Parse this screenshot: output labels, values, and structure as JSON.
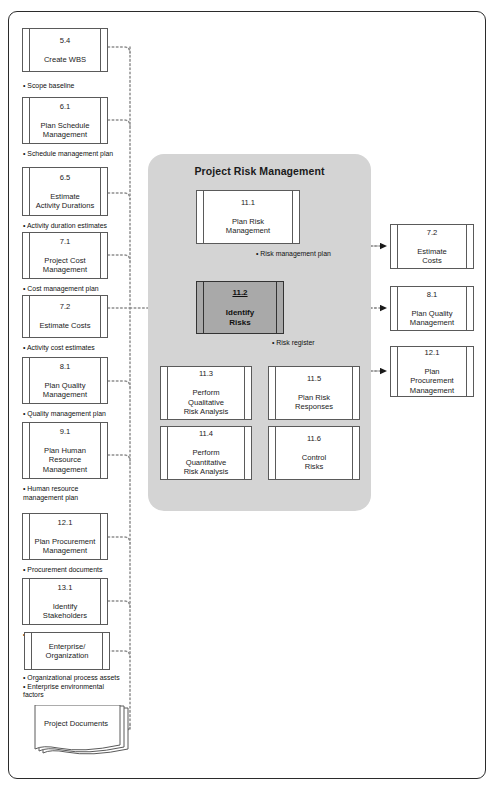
{
  "diagram": {
    "panel_title": "Project Risk Management",
    "accent_color": "#d4d4d4",
    "highlight_color": "#a9a9a9",
    "frame_color": "#2b2b2b"
  },
  "inputs": [
    {
      "name": "create-wbs",
      "num": "5.4",
      "title": "Create WBS",
      "note": "• Scope baseline"
    },
    {
      "name": "plan-schedule-management",
      "num": "6.1",
      "title": "Plan Schedule\nManagement",
      "note": "• Schedule management plan"
    },
    {
      "name": "estimate-activity-durations",
      "num": "6.5",
      "title": "Estimate\nActivity Durations",
      "note": "• Activity duration estimates"
    },
    {
      "name": "project-cost-management",
      "num": "7.1",
      "title": "Project Cost\nManagement",
      "note": "• Cost management plan"
    },
    {
      "name": "estimate-costs",
      "num": "7.2",
      "title": "Estimate Costs",
      "note": "• Activity cost estimates"
    },
    {
      "name": "plan-quality-management",
      "num": "8.1",
      "title": "Plan Quality\nManagement",
      "note": "• Quality management plan"
    },
    {
      "name": "plan-human-resource-management",
      "num": "9.1",
      "title": "Plan Human\nResource\nManagement",
      "note": "• Human resource\n   management plan"
    },
    {
      "name": "plan-procurement-management",
      "num": "12.1",
      "title": "Plan Procurement\nManagement",
      "note": "• Procurement documents"
    },
    {
      "name": "identify-stakeholders",
      "num": "13.1",
      "title": "Identify\nStakeholders",
      "note": "• Stakeholder register"
    }
  ],
  "enterprise": {
    "title": "Enterprise/\nOrganization",
    "note": "• Organizational process assets\n• Enterprise environmental\n   factors"
  },
  "project_documents": {
    "title": "Project\nDocuments"
  },
  "risk_processes": {
    "plan_risk_management": {
      "num": "11.1",
      "title": "Plan Risk\nManagement"
    },
    "identify_risks": {
      "num": "11.2",
      "title": "Identify\nRisks"
    },
    "perform_qualitative_analysis": {
      "num": "11.3",
      "title": "Perform\nQualitative\nRisk Analysis"
    },
    "perform_quantitative_analysis": {
      "num": "11.4",
      "title": "Perform\nQuantitative\nRisk Analysis"
    },
    "plan_risk_responses": {
      "num": "11.5",
      "title": "Plan Risk\nResponses"
    },
    "control_risks": {
      "num": "11.6",
      "title": "Control\nRisks"
    }
  },
  "flow_labels": {
    "risk_management_plan": "• Risk management plan",
    "risk_register": "• Risk register"
  },
  "outputs": [
    {
      "name": "estimate-costs-out",
      "num": "7.2",
      "title": "Estimate\nCosts"
    },
    {
      "name": "plan-quality-management-out",
      "num": "8.1",
      "title": "Plan Quality\nManagement"
    },
    {
      "name": "plan-procurement-management-out",
      "num": "12.1",
      "title": "Plan\nProcurement\nManagement"
    }
  ]
}
